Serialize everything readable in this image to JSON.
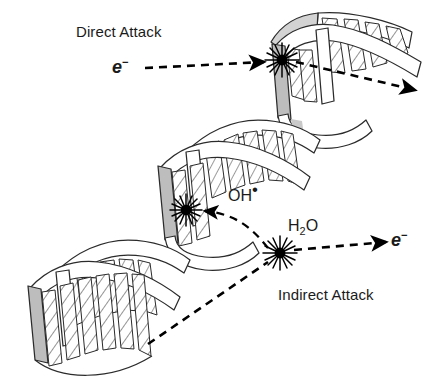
{
  "figure": {
    "background_color": "#ffffff",
    "ink_color": "#1a1a1a",
    "ribbon_fill": "#ffffff",
    "ribbon_shadow": "#a8a8a8",
    "ribbon_midtone": "#c9c9c9",
    "width": 429,
    "height": 384
  },
  "labels": {
    "direct_attack": "Direct Attack",
    "indirect_attack": "Indirect Attack",
    "electron_incoming": "e",
    "electron_incoming_charge": "−",
    "electron_outgoing": "e",
    "electron_outgoing_charge": "−",
    "hydroxyl_radical": "OH",
    "hydroxyl_radical_dot": "•",
    "water": "H",
    "water_subscript": "2",
    "water_oxygen": "O"
  },
  "icons": {
    "dna_double_helix": "dna-helix-icon",
    "impact_burst_direct": "starburst-icon",
    "impact_burst_indirect": "starburst-icon",
    "water_radiolysis_burst": "starburst-icon",
    "arrow_direct_in": "dashed-arrow-icon",
    "arrow_direct_out": "dashed-arrow-icon",
    "arrow_hydroxyl": "curved-dashed-arrow-icon",
    "arrow_electron_out": "dashed-arrow-icon",
    "ray_incoming": "dashed-ray-icon"
  },
  "diagram_elements": {
    "helix_turns": 3,
    "burst_points": [
      {
        "name": "direct-dna-strike",
        "x": 282,
        "y": 60
      },
      {
        "name": "indirect-dna-strike",
        "x": 186,
        "y": 210
      },
      {
        "name": "water-ionization",
        "x": 280,
        "y": 253
      }
    ]
  }
}
